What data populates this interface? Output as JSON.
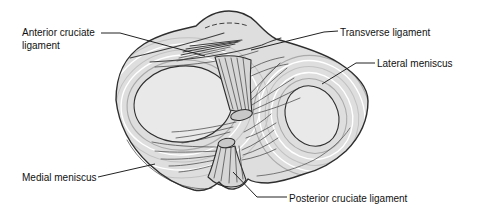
{
  "figure": {
    "labels": {
      "anterior_cruciate_ligament": "Anterior cruciate ligament",
      "transverse_ligament": "Transverse ligament",
      "lateral_meniscus": "Lateral meniscus",
      "medial_meniscus": "Medial meniscus",
      "posterior_cruciate_ligament": "Posterior cruciate ligament"
    }
  },
  "colors": {
    "bg": "#ffffff",
    "outline": "#2e2e2e",
    "plateau": "#dedede",
    "condyle": "#e9e9e9",
    "stump": "#d6d6d6",
    "cutface": "#c9c9c9",
    "fiber": "#3e3e3e",
    "arcdark": "#aaaaaa",
    "arcmid": "#c2c2c2",
    "arclight": "#ffffff",
    "edgeline": "#5a5a5a",
    "label": "#111111",
    "leader": "#222222"
  }
}
